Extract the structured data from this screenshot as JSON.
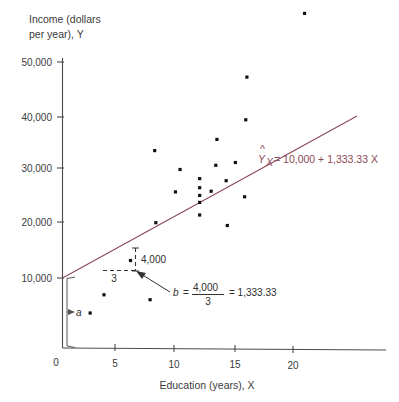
{
  "chart_data": {
    "type": "scatter",
    "title": "",
    "xlabel": "Education (years), X",
    "ylabel": "Income (dollars per year), Y",
    "ylabel_line1": "Income (dollars",
    "ylabel_line2": "per year), Y",
    "xlim": [
      0,
      25
    ],
    "ylim": [
      0,
      52000
    ],
    "grid": false,
    "legend": "none",
    "xticks": [
      0,
      5,
      10,
      15,
      20
    ],
    "xtick_labels": [
      "0",
      "5",
      "10",
      "15",
      "20"
    ],
    "yticks": [
      10000,
      20000,
      30000,
      40000,
      50000
    ],
    "ytick_labels": [
      "10,000",
      "20,000",
      "30,000",
      "40,000",
      "50,000"
    ],
    "points": [
      {
        "x": 2.4,
        "y": 5000
      },
      {
        "x": 3.6,
        "y": 7600
      },
      {
        "x": 7.6,
        "y": 6900
      },
      {
        "x": 5.9,
        "y": 12500
      },
      {
        "x": 8.0,
        "y": 28200
      },
      {
        "x": 8.1,
        "y": 17900
      },
      {
        "x": 9.8,
        "y": 22300
      },
      {
        "x": 10.2,
        "y": 25500
      },
      {
        "x": 11.9,
        "y": 19000
      },
      {
        "x": 11.9,
        "y": 20800
      },
      {
        "x": 11.9,
        "y": 21800
      },
      {
        "x": 11.9,
        "y": 22900
      },
      {
        "x": 11.9,
        "y": 24200
      },
      {
        "x": 12.9,
        "y": 22400
      },
      {
        "x": 13.3,
        "y": 26100
      },
      {
        "x": 13.4,
        "y": 29800
      },
      {
        "x": 14.2,
        "y": 23900
      },
      {
        "x": 14.3,
        "y": 17500
      },
      {
        "x": 15.0,
        "y": 26500
      },
      {
        "x": 15.8,
        "y": 21600
      },
      {
        "x": 15.9,
        "y": 32600
      },
      {
        "x": 16.0,
        "y": 38700
      },
      {
        "x": 21.0,
        "y": 47800
      }
    ],
    "regression": {
      "intercept": 10000,
      "slope": 1333.33,
      "equation_y": "Y",
      "equation_sub": "X",
      "equation_text": "= 10,000 + 1,333.33 X",
      "x_start": 0,
      "x_end": 25,
      "color": "#8c4a55"
    },
    "annotations": {
      "rise_label": "4,000",
      "run_label": "3",
      "slope_formula_b": "b",
      "slope_formula_eq": "=",
      "slope_formula_num": "4,000",
      "slope_formula_den": "3",
      "slope_formula_result": "= 1,333.33",
      "intercept_label": "a",
      "triangle_x_start": 3.5,
      "triangle_x_end": 6.5,
      "triangle_y_low": 14600,
      "triangle_y_high": 18600
    }
  }
}
